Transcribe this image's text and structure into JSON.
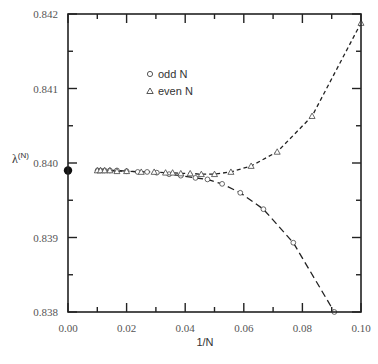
{
  "chart_data": {
    "type": "scatter",
    "title": "",
    "xlabel": "1/N",
    "ylabel": "λ(N)",
    "xlim": [
      0.0,
      0.1
    ],
    "ylim": [
      0.838,
      0.842
    ],
    "x_ticks": [
      "0.00",
      "0.02",
      "0.04",
      "0.06",
      "0.08",
      "0.10"
    ],
    "y_ticks": [
      "0.838",
      "0.839",
      "0.840",
      "0.841",
      "0.842"
    ],
    "grid": false,
    "legend_position": "upper-center",
    "series": [
      {
        "name": "odd N",
        "marker": "open-circle",
        "line": "long-dash",
        "x": [
          0.0101,
          0.0111,
          0.0125,
          0.0143,
          0.0167,
          0.02,
          0.0238,
          0.027,
          0.0303,
          0.0345,
          0.0385,
          0.0435,
          0.0476,
          0.0526,
          0.0588,
          0.0667,
          0.0769,
          0.0909
        ],
        "y": [
          0.8399,
          0.8399,
          0.8399,
          0.8399,
          0.8399,
          0.83989,
          0.83988,
          0.83988,
          0.83987,
          0.83985,
          0.83983,
          0.8398,
          0.83978,
          0.83972,
          0.8396,
          0.83938,
          0.83893,
          0.838
        ]
      },
      {
        "name": "even N",
        "marker": "open-triangle",
        "line": "short-dash",
        "x": [
          0.01,
          0.0111,
          0.0125,
          0.0143,
          0.0167,
          0.02,
          0.025,
          0.0294,
          0.0333,
          0.0357,
          0.0385,
          0.0417,
          0.0455,
          0.05,
          0.0556,
          0.0625,
          0.0714,
          0.0833,
          0.1
        ],
        "y": [
          0.8399,
          0.8399,
          0.8399,
          0.8399,
          0.83989,
          0.83989,
          0.83988,
          0.83988,
          0.83987,
          0.83987,
          0.83986,
          0.83986,
          0.83985,
          0.83985,
          0.83988,
          0.83996,
          0.84015,
          0.84063,
          0.84188
        ]
      },
      {
        "name": "extrapolated limit",
        "marker": "filled-circle",
        "x": [
          0.0
        ],
        "y": [
          0.8399
        ]
      }
    ]
  },
  "legend": {
    "odd_label": "odd N",
    "even_label": "even N"
  },
  "axes": {
    "xlabel": "1/N",
    "ylabel_main": "λ",
    "ylabel_sup": "(N)"
  }
}
